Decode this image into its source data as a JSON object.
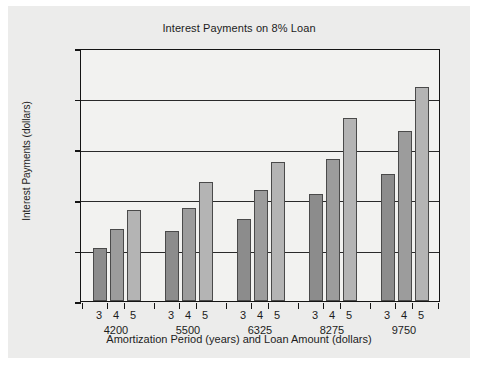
{
  "chart_data": {
    "type": "bar",
    "title": "Interest Payments on 8% Loan",
    "xlabel": "Amortization Period (years) and Loan Amount (dollars)",
    "ylabel": "Interest Payments (dollars)",
    "ylim": [
      0,
      2500
    ],
    "yticks": [
      0,
      500,
      1000,
      1500,
      2000,
      2500
    ],
    "ytick_labels": [
      "0",
      "500",
      "1000",
      "1500",
      "2000",
      "2500"
    ],
    "grid": true,
    "legend": "none",
    "categories": [
      "4200",
      "5500",
      "6325",
      "8275",
      "9750"
    ],
    "subcategories": [
      "3",
      "4",
      "5"
    ],
    "series": [
      {
        "name": "3",
        "values": [
          520,
          690,
          815,
          1060,
          1260
        ],
        "color": "#8c8c8c"
      },
      {
        "name": "4",
        "values": [
          710,
          920,
          1095,
          1400,
          1680
        ],
        "color": "#9c9c9c"
      },
      {
        "name": "5",
        "values": [
          900,
          1180,
          1370,
          1810,
          2110
        ],
        "color": "#b4b4b4"
      }
    ],
    "groups": [
      {
        "loan_amount": "4200",
        "bars": [
          {
            "year": "3",
            "value": 520,
            "color": "#8c8c8c"
          },
          {
            "year": "4",
            "value": 710,
            "color": "#9c9c9c"
          },
          {
            "year": "5",
            "value": 900,
            "color": "#b4b4b4"
          }
        ]
      },
      {
        "loan_amount": "5500",
        "bars": [
          {
            "year": "3",
            "value": 690,
            "color": "#8c8c8c"
          },
          {
            "year": "4",
            "value": 920,
            "color": "#9c9c9c"
          },
          {
            "year": "5",
            "value": 1180,
            "color": "#b4b4b4"
          }
        ]
      },
      {
        "loan_amount": "6325",
        "bars": [
          {
            "year": "3",
            "value": 815,
            "color": "#8c8c8c"
          },
          {
            "year": "4",
            "value": 1095,
            "color": "#9c9c9c"
          },
          {
            "year": "5",
            "value": 1370,
            "color": "#b4b4b4"
          }
        ]
      },
      {
        "loan_amount": "8275",
        "bars": [
          {
            "year": "3",
            "value": 1060,
            "color": "#8c8c8c"
          },
          {
            "year": "4",
            "value": 1400,
            "color": "#9c9c9c"
          },
          {
            "year": "5",
            "value": 1810,
            "color": "#b4b4b4"
          }
        ]
      },
      {
        "loan_amount": "9750",
        "bars": [
          {
            "year": "3",
            "value": 1260,
            "color": "#8c8c8c"
          },
          {
            "year": "4",
            "value": 1680,
            "color": "#9c9c9c"
          },
          {
            "year": "5",
            "value": 2110,
            "color": "#b4b4b4"
          }
        ]
      }
    ]
  },
  "style": {
    "figure_background": "#ececeb",
    "plot_background": "#f2f2f0",
    "axis_color": "#141414",
    "grid_color": "#2a2a2a",
    "text_color": "#1c1c1c"
  }
}
